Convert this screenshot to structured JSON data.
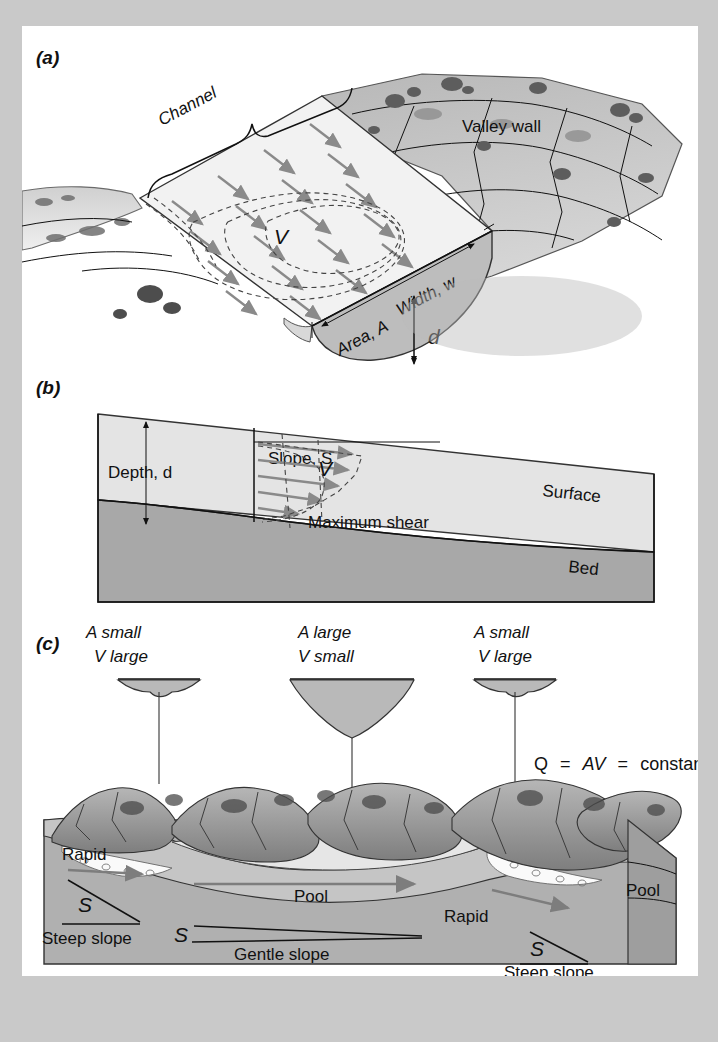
{
  "figure": {
    "background_color": "#c9c9c9",
    "sheet_color": "#ffffff"
  },
  "panels": [
    {
      "id": "a",
      "label": "(a)",
      "type": "block-diagram-oblique",
      "labels": {
        "channel": "Channel",
        "valley_wall": "Valley wall",
        "velocity": "V",
        "width": "Width, w",
        "area": "Area, A",
        "depth": "d"
      }
    },
    {
      "id": "b",
      "label": "(b)",
      "type": "longitudinal-profile",
      "labels": {
        "depth": "Depth, d",
        "slope": "Slope, S",
        "velocity": "V",
        "surface": "Surface",
        "maximum_shear": "Maximum shear",
        "bed": "Bed"
      }
    },
    {
      "id": "c",
      "label": "(c)",
      "type": "landscape-block-diagram",
      "callouts": [
        {
          "area": "A small",
          "velocity": "V large",
          "shape": "wide-shallow"
        },
        {
          "area": "A large",
          "velocity": "V small",
          "shape": "deep-parabolic"
        },
        {
          "area": "A small",
          "velocity": "V large",
          "shape": "wide-shallow"
        }
      ],
      "equation": {
        "q": "Q",
        "eq1": "=",
        "av": "AV",
        "eq2": "=",
        "constant": "constant"
      },
      "labels": {
        "rapid_left": "Rapid",
        "rapid_right": "Rapid",
        "slope_symbol_left": "S",
        "slope_symbol_mid": "S",
        "slope_symbol_right": "S",
        "steep_slope_left": "Steep slope",
        "steep_slope_right": "Steep slope",
        "gentle_slope": "Gentle slope",
        "pool_center": "Pool",
        "pool_right": "Pool"
      }
    }
  ],
  "colors": {
    "water_light": "#e8e8e8",
    "water_mid": "#bdbdbd",
    "bed_dark": "#9a9a9a",
    "rock_gray": "#a9a9a9",
    "arrow_gray": "#8a8a8a",
    "ink": "#111111"
  }
}
